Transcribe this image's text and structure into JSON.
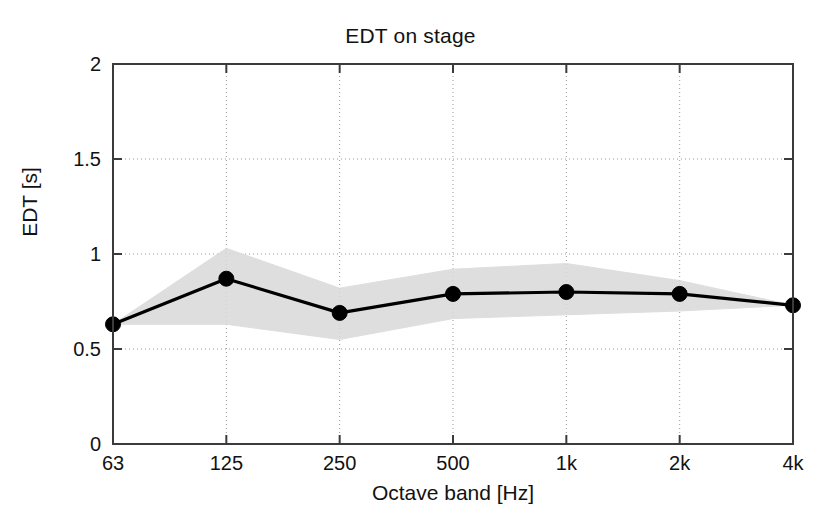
{
  "chart_data": {
    "type": "line",
    "title": "EDT on stage",
    "xlabel": "Octave band [Hz]",
    "ylabel": "EDT [s]",
    "categories": [
      "63",
      "125",
      "250",
      "500",
      "1k",
      "2k",
      "4k"
    ],
    "values": [
      0.63,
      0.87,
      0.69,
      0.79,
      0.8,
      0.79,
      0.73
    ],
    "series": [
      {
        "name": "EDT mean",
        "values": [
          0.63,
          0.87,
          0.69,
          0.79,
          0.8,
          0.79,
          0.73
        ]
      },
      {
        "name": "spread band upper",
        "values": [
          0.63,
          1.03,
          0.82,
          0.92,
          0.95,
          0.86,
          0.73
        ]
      },
      {
        "name": "spread band lower",
        "values": [
          0.63,
          0.63,
          0.55,
          0.66,
          0.68,
          0.7,
          0.73
        ]
      }
    ],
    "ylim": [
      0,
      2
    ],
    "yticks": [
      "0",
      "0.5",
      "1",
      "1.5",
      "2"
    ],
    "ytick_values": [
      0,
      0.5,
      1,
      1.5,
      2
    ],
    "xticks": [
      "63",
      "125",
      "250",
      "500",
      "1k",
      "2k",
      "4k"
    ],
    "grid": true,
    "grid_style": "dotted",
    "legend": "none",
    "marker": "filled-circle",
    "line_color": "#000000",
    "band_color": "#d9d9d9",
    "axis_color": "#3b3b3b",
    "grid_color": "#9a9a9a"
  },
  "figure": {
    "title": "EDT on stage",
    "x_axis_title": "Octave band [Hz]",
    "y_axis_title": "EDT [s]"
  }
}
